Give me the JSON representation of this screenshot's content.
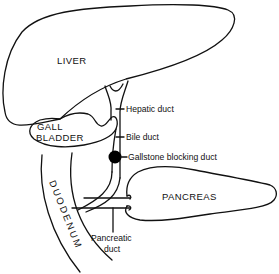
{
  "diagram": {
    "type": "anatomical-line-drawing",
    "colors": {
      "line": "#111111",
      "background": "#ffffff",
      "gallstone": "#000000"
    },
    "organs": {
      "liver": "LIVER",
      "gallbladder_line1": "GALL",
      "gallbladder_line2": "BLADDER",
      "pancreas": "PANCREAS",
      "duodenum": "DUODENUM"
    },
    "callouts": {
      "hepatic_duct": "Hepatic duct",
      "bile_duct": "Bile duct",
      "gallstone": "Gallstone blocking duct",
      "pancreatic_duct_line1": "Pancreatic",
      "pancreatic_duct_line2": "duct"
    }
  }
}
